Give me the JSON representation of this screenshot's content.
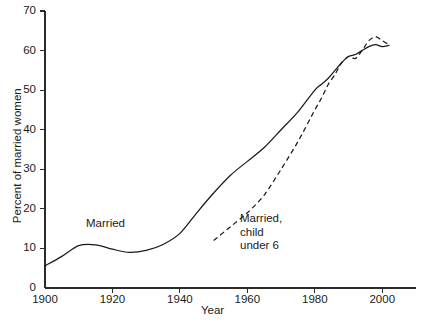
{
  "chart_data": {
    "type": "line",
    "title": "",
    "xlabel": "Year",
    "ylabel": "Percent of married women",
    "xlim": [
      1900,
      2010
    ],
    "ylim": [
      0,
      70
    ],
    "grid": false,
    "legend_position": "inline-annotation",
    "xticks": [
      1900,
      1920,
      1940,
      1960,
      1980,
      2000
    ],
    "xtick_labels": [
      "1900",
      "1920",
      "1940",
      "1960",
      "1980",
      "2000"
    ],
    "yticks": [
      0,
      10,
      20,
      30,
      40,
      50,
      60,
      70
    ],
    "ytick_labels": [
      "0",
      "10",
      "20",
      "30",
      "40",
      "50",
      "60",
      "70"
    ],
    "series": [
      {
        "name": "Married",
        "style": "solid",
        "annotation": "Married",
        "x": [
          1900,
          1905,
          1910,
          1915,
          1920,
          1925,
          1930,
          1935,
          1940,
          1945,
          1950,
          1955,
          1960,
          1965,
          1970,
          1975,
          1980,
          1982,
          1984,
          1986,
          1988,
          1990,
          1992,
          1994,
          1996,
          1998,
          2000,
          2002
        ],
        "values": [
          5.6,
          8.0,
          10.7,
          10.9,
          9.8,
          9.0,
          9.5,
          11.0,
          13.8,
          19.0,
          24.0,
          28.5,
          32.0,
          35.5,
          40.0,
          44.5,
          50.0,
          51.5,
          53.0,
          55.0,
          57.0,
          58.5,
          59.0,
          60.0,
          61.0,
          61.5,
          61.0,
          61.3
        ]
      },
      {
        "name": "Married, child under 6",
        "style": "dashed",
        "annotation": "Married,\nchild\nunder 6",
        "x": [
          1950,
          1955,
          1960,
          1965,
          1970,
          1975,
          1980,
          1982,
          1984,
          1986,
          1988,
          1990,
          1992,
          1994,
          1996,
          1998,
          2000,
          2002
        ],
        "values": [
          12.0,
          15.5,
          19.0,
          23.5,
          30.0,
          37.0,
          45.0,
          48.0,
          51.5,
          54.0,
          57.0,
          58.5,
          58.0,
          60.0,
          62.5,
          63.5,
          62.5,
          61.5
        ]
      }
    ]
  },
  "axes": {
    "x_title": "Year",
    "y_title": "Percent of married women"
  },
  "colors": {
    "background": "#ffffff",
    "axis": "#2b2b2b",
    "line": "#1a1a1a",
    "text": "#1a1a1a"
  }
}
